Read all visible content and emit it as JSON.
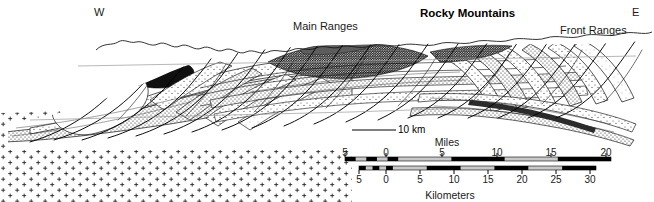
{
  "figure": {
    "kind": "geologic-cross-section",
    "title": "Rocky Mountains",
    "compass": {
      "west": "W",
      "east": "E"
    },
    "region_labels": [
      {
        "name": "main-ranges",
        "text": "Main Ranges",
        "x": 296,
        "y": 27
      },
      {
        "name": "front-ranges",
        "text": "Front Ranges",
        "x": 561,
        "y": 31
      }
    ],
    "title_pos": {
      "x": 421,
      "y": 14
    },
    "compass_pos": {
      "west_x": 98,
      "west_y": 13,
      "east_x": 636,
      "east_y": 13
    },
    "vertical_scale_label": "10 km",
    "vertical_scale_pos": {
      "x": 400,
      "y": 133
    },
    "colors": {
      "ink": "#000000",
      "background": "#ffffff",
      "stipple_light": "#d8d8d8",
      "stipple_mid": "#b0b0b0",
      "stipple_dark": "#6e6e6e",
      "dark_unit": "#1a1a1a",
      "basement_cross": "#222222",
      "bar_fill_light": "#c9c9c9"
    }
  },
  "scale": {
    "miles": {
      "unit_label": "Miles",
      "unit_label_pos": {
        "x": 447,
        "y": 137
      },
      "tick_labels": [
        "5",
        "0",
        "5",
        "10",
        "15",
        "20"
      ],
      "tick_values": [
        -5,
        0,
        5,
        10,
        15,
        20
      ],
      "tick_x": [
        345,
        386,
        442,
        497,
        551,
        606
      ],
      "labels_y": 148,
      "bar_y": 157,
      "bar_height": 4,
      "bar_left": 345,
      "bar_right": 611,
      "segments": [
        {
          "from": -5,
          "to": -4,
          "filled": true
        },
        {
          "from": -4,
          "to": -3,
          "filled": false
        },
        {
          "from": -3,
          "to": -2,
          "filled": true
        },
        {
          "from": -2,
          "to": -1,
          "filled": false
        },
        {
          "from": -1,
          "to": 0,
          "filled": true
        },
        {
          "from": 0,
          "to": 5,
          "filled": false
        },
        {
          "from": 5,
          "to": 10,
          "filled": true
        },
        {
          "from": 10,
          "to": 15,
          "filled": false
        },
        {
          "from": 15,
          "to": 20,
          "filled": true
        }
      ]
    },
    "kilometers": {
      "unit_label": "Kilometers",
      "unit_label_pos": {
        "x": 450,
        "y": 190
      },
      "tick_labels": [
        "5",
        "0",
        "5",
        "10",
        "15",
        "20",
        "25",
        "30"
      ],
      "tick_values": [
        -5,
        0,
        5,
        10,
        15,
        20,
        25,
        30
      ],
      "tick_x": [
        359,
        386,
        420,
        454,
        488,
        522,
        556,
        590
      ],
      "labels_y": 175,
      "bar_y": 166,
      "bar_height": 4,
      "bar_left": 359,
      "bar_right": 596,
      "segments": [
        {
          "from": -5,
          "to": -4,
          "filled": true
        },
        {
          "from": -4,
          "to": -3,
          "filled": false
        },
        {
          "from": -3,
          "to": -2,
          "filled": true
        },
        {
          "from": -2,
          "to": -1,
          "filled": false
        },
        {
          "from": -1,
          "to": 0,
          "filled": true
        },
        {
          "from": 0,
          "to": 5,
          "filled": false
        },
        {
          "from": 5,
          "to": 10,
          "filled": true
        },
        {
          "from": 10,
          "to": 15,
          "filled": false
        },
        {
          "from": 15,
          "to": 20,
          "filled": true
        },
        {
          "from": 20,
          "to": 25,
          "filled": false
        },
        {
          "from": 25,
          "to": 30,
          "filled": true
        }
      ]
    }
  },
  "cross_section": {
    "extent": {
      "x0": 8,
      "x1": 650,
      "y_top": 33,
      "y_base": 150
    },
    "basement": {
      "name": "crystalline-basement",
      "symbol": "+",
      "description": "cross/plus ornament indicating crystalline basement"
    },
    "layers": [
      {
        "name": "thrust-sheet-1",
        "shade": "light"
      },
      {
        "name": "thrust-sheet-2",
        "shade": "mid"
      },
      {
        "name": "thrust-sheet-3",
        "shade": "dark"
      },
      {
        "name": "thrust-sheet-4",
        "shade": "light"
      }
    ]
  }
}
